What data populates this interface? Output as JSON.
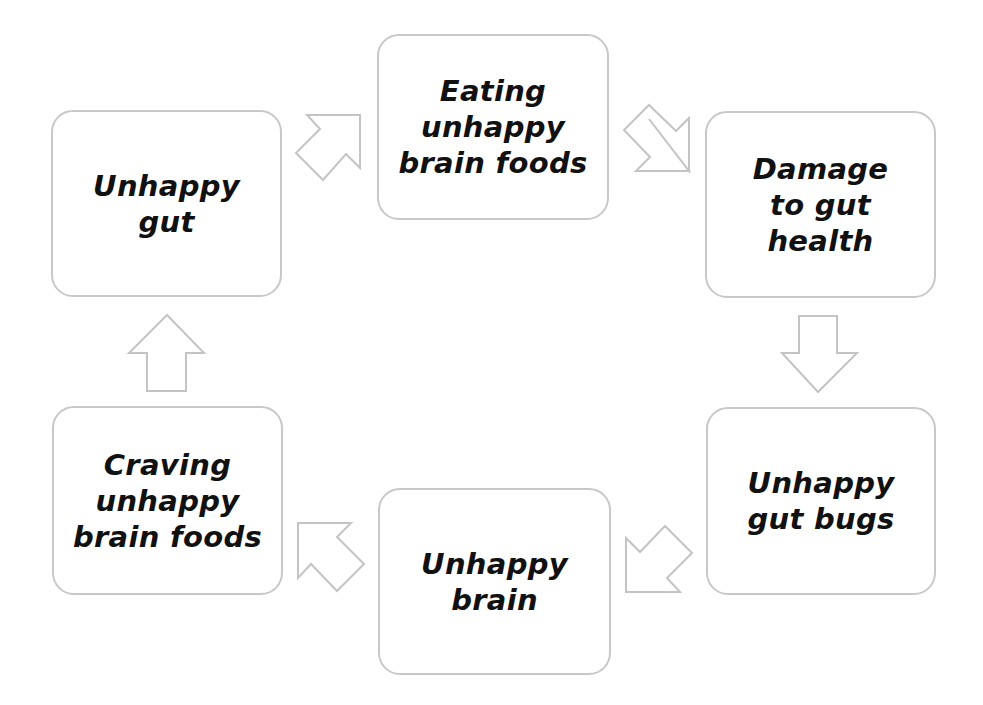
{
  "diagram": {
    "type": "cycle",
    "nodes": [
      {
        "id": "unhappy-gut",
        "label": "Unhappy\ngut"
      },
      {
        "id": "eating-unhappy-brain-foods",
        "label": "Eating\nunhappy\nbrain foods"
      },
      {
        "id": "damage-to-gut-health",
        "label": "Damage\nto gut\nhealth"
      },
      {
        "id": "unhappy-gut-bugs",
        "label": "Unhappy\ngut bugs"
      },
      {
        "id": "unhappy-brain",
        "label": "Unhappy\nbrain"
      },
      {
        "id": "craving-unhappy-brain-foods",
        "label": "Craving\nunhappy\nbrain foods"
      }
    ],
    "edges": [
      {
        "from": "unhappy-gut",
        "to": "eating-unhappy-brain-foods",
        "direction": "up-right"
      },
      {
        "from": "eating-unhappy-brain-foods",
        "to": "damage-to-gut-health",
        "direction": "down-right"
      },
      {
        "from": "damage-to-gut-health",
        "to": "unhappy-gut-bugs",
        "direction": "down"
      },
      {
        "from": "unhappy-gut-bugs",
        "to": "unhappy-brain",
        "direction": "down-left"
      },
      {
        "from": "unhappy-brain",
        "to": "craving-unhappy-brain-foods",
        "direction": "up-left"
      },
      {
        "from": "craving-unhappy-brain-foods",
        "to": "unhappy-gut",
        "direction": "up"
      }
    ],
    "colors": {
      "node_border": "#c8c8c8",
      "arrow_outline": "#c4c4c4",
      "text": "#111111",
      "background": "#ffffff"
    }
  }
}
